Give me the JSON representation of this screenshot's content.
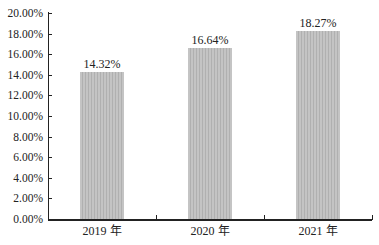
{
  "chart_data": {
    "type": "bar",
    "title": "",
    "xlabel": "",
    "ylabel": "",
    "categories": [
      "2019 年",
      "2020 年",
      "2021 年"
    ],
    "values": [
      14.32,
      16.64,
      18.27
    ],
    "value_labels": [
      "14.32%",
      "16.64%",
      "18.27%"
    ],
    "ylim": [
      0,
      20
    ],
    "yticks": [
      "0.00%",
      "2.00%",
      "4.00%",
      "6.00%",
      "8.00%",
      "10.00%",
      "12.00%",
      "14.00%",
      "16.00%",
      "18.00%",
      "20.00%"
    ],
    "grid": false,
    "legend": null,
    "bar_color": "#bdbdbd"
  }
}
